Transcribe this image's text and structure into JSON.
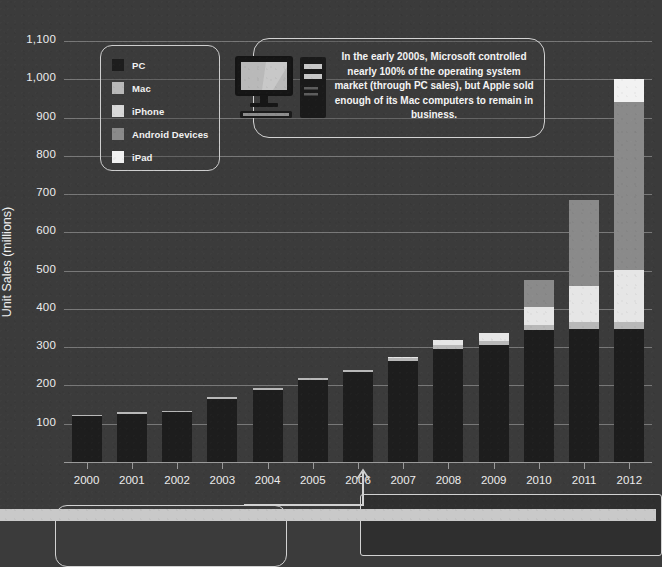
{
  "chart_data": {
    "type": "bar",
    "stacked": true,
    "title": "",
    "xlabel": "",
    "ylabel": "Unit Sales (millions)",
    "ylim": [
      0,
      1150
    ],
    "ytick_values": [
      100,
      200,
      300,
      400,
      500,
      600,
      700,
      800,
      900,
      1000,
      1100
    ],
    "ytick_labels": [
      "100",
      "200",
      "300",
      "400",
      "500",
      "600",
      "700",
      "800",
      "900",
      "1,000",
      "1,100"
    ],
    "categories": [
      "2000",
      "2001",
      "2002",
      "2003",
      "2004",
      "2005",
      "2006",
      "2007",
      "2008",
      "2009",
      "2010",
      "2011",
      "2012"
    ],
    "grid": true,
    "legend_position": "upper-left",
    "series": [
      {
        "name": "PC",
        "color": "#1d1d1d",
        "values": [
          120,
          126,
          130,
          165,
          188,
          215,
          234,
          265,
          295,
          305,
          345,
          348,
          348
        ]
      },
      {
        "name": "Mac",
        "color": "#b8b8b8",
        "values": [
          4,
          4,
          4,
          4,
          5,
          5,
          6,
          8,
          10,
          11,
          14,
          18,
          19
        ]
      },
      {
        "name": "iPhone",
        "color": "#e6e6e6",
        "values": [
          0,
          0,
          0,
          0,
          0,
          0,
          0,
          2,
          14,
          22,
          46,
          93,
          135
        ]
      },
      {
        "name": "Android Devices",
        "color": "#8a8a8a",
        "values": [
          0,
          0,
          0,
          0,
          0,
          0,
          0,
          0,
          0,
          0,
          70,
          225,
          440
        ]
      },
      {
        "name": "iPad",
        "color": "#f2f2f2",
        "values": [
          0,
          0,
          0,
          0,
          0,
          0,
          0,
          0,
          0,
          0,
          0,
          0,
          58
        ]
      }
    ],
    "totals": [
      124,
      130,
      134,
      169,
      193,
      220,
      240,
      275,
      319,
      338,
      475,
      684,
      1000
    ],
    "annotations": [
      {
        "id": "callout-2000s",
        "text": "In the early 2000s, Microsoft controlled nearly 100% of the operating system market (through PC sales), but Apple sold enough of its Mac computers to remain in business."
      }
    ]
  },
  "legend": {
    "items": [
      {
        "label": "PC",
        "color": "#1d1d1d"
      },
      {
        "label": "Mac",
        "color": "#b8b8b8"
      },
      {
        "label": "iPhone",
        "color": "#d8d8d8"
      },
      {
        "label": "Android Devices",
        "color": "#8a8a8a"
      },
      {
        "label": "iPad",
        "color": "#f2f2f2"
      }
    ]
  },
  "callout": {
    "text": "In the early 2000s, Microsoft controlled nearly 100% of the operating system market (through PC sales), but Apple sold enough of its Mac computers to remain in business."
  },
  "colors": {
    "background": "#3b3b3b",
    "grid": "#8e8e8e",
    "text": "#ededed",
    "outline": "#d2d2d2",
    "bottom_band": "#c9c9c9"
  }
}
